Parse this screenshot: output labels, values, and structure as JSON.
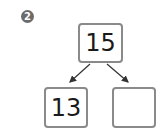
{
  "problem": {
    "number_badge": "2",
    "top_value": "15",
    "bottom_left_value": "13",
    "bottom_right_value": ""
  },
  "colors": {
    "badge_bg": "#6b6b6b",
    "box_border": "#8a8a8a",
    "text": "#1a1a1a",
    "arrow": "#333333"
  }
}
